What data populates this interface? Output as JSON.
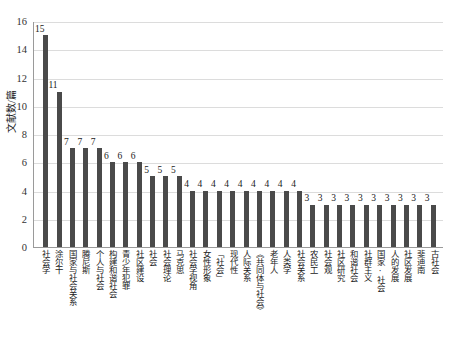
{
  "chart_data": {
    "type": "bar",
    "title": "",
    "xlabel": "",
    "ylabel": "文献数/篇",
    "ylim": [
      0,
      16
    ],
    "yticks": [
      0,
      2,
      4,
      6,
      8,
      10,
      12,
      14,
      16
    ],
    "grid": true,
    "legend": "none",
    "bar_color": "#4a4a4a",
    "gridline_color": "#dcdcdc",
    "axis_color": "#9a9a9a",
    "categories": [
      "社会学",
      "涂尔干",
      "国家与社会关系",
      "腾尼斯",
      "个人与社会",
      "构建和谐社会",
      "青少年犯罪",
      "社区建设",
      "社会",
      "社会理论",
      "马克思",
      "社会学视角",
      "女性形象",
      "「社会」",
      "现代性",
      "人际关系",
      "《共同体与社会》",
      "老年人",
      "人类学",
      "社会关系",
      "农民工",
      "社会观",
      "社区研究",
      "和谐社会",
      "社群主义",
      "国家·社会",
      "人的发展",
      "社区发展",
      "斐迪南",
      "古社会"
    ],
    "values": [
      15,
      11,
      7,
      7,
      7,
      6,
      6,
      6,
      5,
      5,
      5,
      4,
      4,
      4,
      4,
      4,
      4,
      4,
      4,
      4,
      3,
      3,
      3,
      3,
      3,
      3,
      3,
      3,
      3,
      3
    ]
  },
  "caption": {
    "text": ""
  }
}
